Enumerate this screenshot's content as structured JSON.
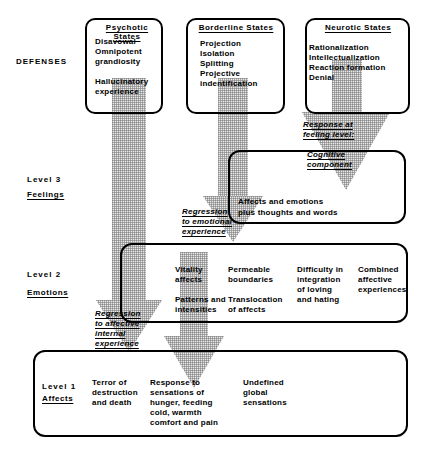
{
  "diagram": {
    "row_labels": [
      {
        "id": "defenses",
        "text": "DEFENSES"
      },
      {
        "id": "level3",
        "number": "Level  3",
        "name": "Feelings"
      },
      {
        "id": "level2",
        "number": "Level  2",
        "name": "Emotions"
      },
      {
        "id": "level1",
        "number": "Level  1",
        "name": "Affects"
      }
    ],
    "defense_boxes": [
      {
        "id": "psychotic",
        "header": "Psychotic  States",
        "items": "Disavowal\nOmnipotent\ngrandiosity\n\nHallucinatory\nexperience"
      },
      {
        "id": "borderline",
        "header": "Borderline  States",
        "items": "Projection\nIsolation\nSplitting\nProjective\nindentification"
      },
      {
        "id": "neurotic",
        "header": "Neurotic  States",
        "items": "Rationalization\nIntellectualization\nReaction  formation\nDenial"
      }
    ],
    "arrow_labels": [
      {
        "id": "response-feeling",
        "text": "Response at\nfeeling  level:"
      },
      {
        "id": "cognitive",
        "text": "Cognitive\ncomponent"
      },
      {
        "id": "regression-emotional",
        "text": "Regression\nto  emotional\nexperience"
      },
      {
        "id": "regression-affective",
        "text": "Regression\nto  affective\ninternal\nexperience"
      }
    ],
    "level3_box": {
      "id": "level3-content",
      "text": "Affects  and  emotions\nplus  thoughts  and  words"
    },
    "level2_box": {
      "id": "level2-content",
      "columns": [
        {
          "id": "vitality",
          "text": "Vitality\naffects\n\nPatterns  and\nintensities"
        },
        {
          "id": "permeable",
          "text": "Permeable\nboundaries\n\nTranslocation\nof  affects"
        },
        {
          "id": "difficulty",
          "text": "Difficulty  in\nintegration\nof  loving\nand  hating"
        },
        {
          "id": "combined",
          "text": "Combined\naffective\nexperiences"
        }
      ]
    },
    "level1_box": {
      "id": "level1-content",
      "columns": [
        {
          "id": "terror",
          "text": "Terror  of\ndestruction\nand  death"
        },
        {
          "id": "response-sensations",
          "text": "Response  to\nsensations  of\n  hunger,  feeding\ncold,  warmth\ncomfort  and  pain"
        },
        {
          "id": "undefined",
          "text": "Undefined\nglobal\nsensations"
        }
      ]
    },
    "colors": {
      "ink": "#000000",
      "arrow_fill": "#e9e9e9",
      "arrow_hatch": "#787878",
      "background": "#ffffff"
    }
  }
}
